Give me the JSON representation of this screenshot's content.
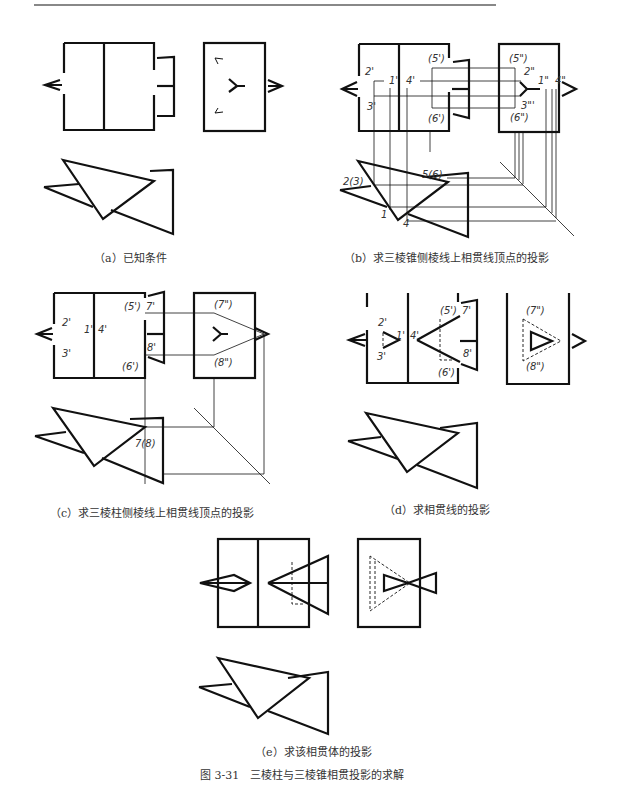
{
  "figure": {
    "title": "图 3-31　三棱柱与三棱锥相贯投影的求解",
    "panels": [
      {
        "id": "a",
        "caption": "（a）已知条件"
      },
      {
        "id": "b",
        "caption": "（b）求三棱锥侧棱线上相贯线顶点的投影",
        "labels": [
          "(5')",
          "2'",
          "1'",
          "4'",
          "3'",
          "(6')",
          "(5\")",
          "2\"",
          "1\"",
          "4\"",
          "3\"",
          "(6\")",
          "2(3)",
          "5(6)",
          "1",
          "4"
        ]
      },
      {
        "id": "c",
        "caption": "（c）求三棱柱侧棱线上相贯线顶点的投影",
        "labels": [
          "(5')",
          "7'",
          "2'",
          "1'",
          "4'",
          "3'",
          "8'",
          "(6')",
          "(7\")",
          "(8\")",
          "7(8)"
        ]
      },
      {
        "id": "d",
        "caption": "（d）求相贯线的投影",
        "labels": [
          "(5')",
          "7'",
          "2'",
          "1'",
          "4'",
          "3'",
          "8'",
          "(6')",
          "(7\")",
          "(8\")"
        ]
      },
      {
        "id": "e",
        "caption": "（e）求该相贯体的投影"
      }
    ]
  }
}
